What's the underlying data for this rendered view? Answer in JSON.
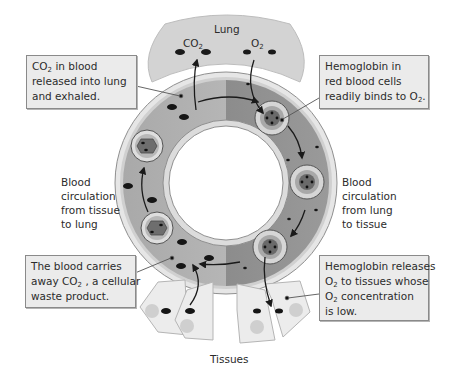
{
  "labels": {
    "lung": "Lung",
    "tissues": "Tissues",
    "co2_lung": {
      "base": "CO",
      "sub": "2"
    },
    "o2_lung": {
      "base": "O",
      "sub": "2"
    },
    "left_flow": [
      "Blood",
      "circulation",
      "from tissue",
      "to lung"
    ],
    "right_flow": [
      "Blood",
      "circulation",
      "from lung",
      "to tissue"
    ]
  },
  "callouts": {
    "top_left": {
      "line1_pre": "CO",
      "line1_sub": "2",
      "line1_post": " in blood",
      "line2": "released into lung",
      "line3": "and exhaled."
    },
    "top_right": {
      "line1": "Hemoglobin in",
      "line2": "red blood cells",
      "line3_pre": "readily binds to O",
      "line3_sub": "2",
      "line3_post": "."
    },
    "bottom_left": {
      "line1": "The blood carries",
      "line2_pre": "away CO",
      "line2_sub": "2",
      "line2_post": " , a cellular",
      "line3": "waste product."
    },
    "bottom_right": {
      "line1": "Hemoglobin releases",
      "line2_pre": "O",
      "line2_sub": "2",
      "line2_post": " to tissues whose",
      "line3_pre": "O",
      "line3_sub": "2",
      "line3_post": " concentration",
      "line4": "is low."
    }
  },
  "colors": {
    "background": "#ffffff",
    "callout_fill": "#ebebeb",
    "callout_border": "#8a8a8a",
    "lung_fill": "#d4d4d4",
    "vessel_left": "#b0b0b0",
    "vessel_right": "#8c8c8c",
    "tissue_fill": "#ececec",
    "molecule": "#1a1a1a"
  }
}
